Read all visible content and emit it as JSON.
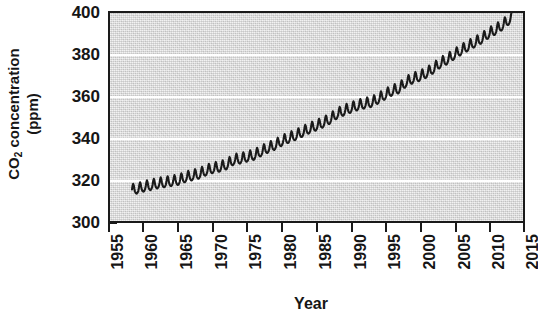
{
  "chart_data": {
    "type": "line",
    "title": "",
    "subtitle": "",
    "xlabel": "Year",
    "ylabel_line1": "CO2 concentration",
    "ylabel_line2": "(ppm)",
    "ylabel_plain": "CO2 concentration (ppm)",
    "xlim": [
      1955,
      2015
    ],
    "ylim": [
      300,
      400
    ],
    "xticks": [
      1955,
      1960,
      1965,
      1970,
      1975,
      1980,
      1985,
      1990,
      1995,
      2000,
      2005,
      2010,
      2015
    ],
    "yticks": [
      300,
      320,
      340,
      360,
      380,
      400
    ],
    "xtick_labels": [
      "1955",
      "1960",
      "1965",
      "1970",
      "1975",
      "1980",
      "1985",
      "1990",
      "1995",
      "2000",
      "2005",
      "2010",
      "2015"
    ],
    "ytick_labels": [
      "300",
      "320",
      "340",
      "360",
      "380",
      "400"
    ],
    "grid": "horizontal-only-white",
    "gridline_values": [
      320,
      340,
      360,
      380
    ],
    "legend": "none",
    "annotations": [],
    "series_name": "Mauna Loa atmospheric CO2 (Keeling Curve)",
    "seasonal_amplitude_ppm": 6.0,
    "data_start_year": 1958.2,
    "data_end_year": 2013.4,
    "data_start_value_ppm": 315.0,
    "data_end_value_ppm": 397.0,
    "annual_mean": {
      "years": [
        1958,
        1959,
        1960,
        1961,
        1962,
        1963,
        1964,
        1965,
        1966,
        1967,
        1968,
        1969,
        1970,
        1971,
        1972,
        1973,
        1974,
        1975,
        1976,
        1977,
        1978,
        1979,
        1980,
        1981,
        1982,
        1983,
        1984,
        1985,
        1986,
        1987,
        1988,
        1989,
        1990,
        1991,
        1992,
        1993,
        1994,
        1995,
        1996,
        1997,
        1998,
        1999,
        2000,
        2001,
        2002,
        2003,
        2004,
        2005,
        2006,
        2007,
        2008,
        2009,
        2010,
        2011,
        2012,
        2013
      ],
      "values_ppm": [
        315.3,
        315.9,
        316.9,
        317.6,
        318.4,
        318.9,
        319.5,
        320.0,
        321.4,
        322.2,
        323.0,
        324.6,
        325.7,
        326.3,
        327.5,
        329.7,
        330.2,
        331.1,
        332.0,
        333.8,
        335.4,
        336.8,
        338.7,
        340.1,
        341.4,
        343.0,
        344.6,
        346.0,
        347.4,
        349.2,
        351.6,
        353.1,
        354.4,
        355.6,
        356.4,
        357.1,
        358.8,
        360.8,
        362.6,
        363.7,
        366.7,
        368.4,
        369.5,
        371.1,
        373.2,
        375.8,
        377.5,
        379.8,
        381.9,
        383.8,
        385.6,
        387.4,
        389.9,
        391.6,
        393.8,
        396.5
      ]
    }
  },
  "figure": {
    "plot_bg_color": "#dddddd",
    "gridline_color": "#ffffff",
    "axis_color": "#1a1a1a",
    "line_color": "#1a1a1a",
    "page_bg_color": "#ffffff"
  }
}
